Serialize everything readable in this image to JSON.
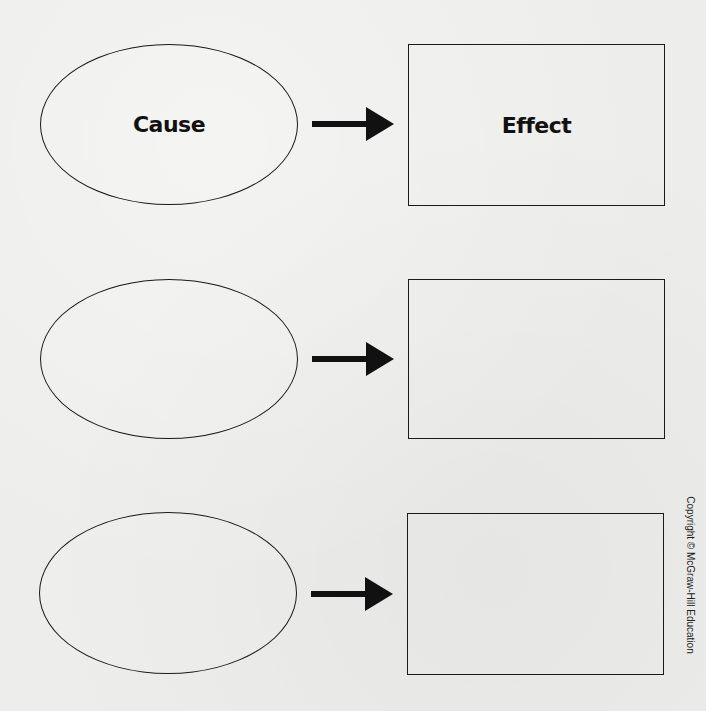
{
  "diagram": {
    "type": "cause-effect graphic organizer",
    "rows": [
      {
        "cause": {
          "label": "Cause"
        },
        "effect": {
          "label": "Effect"
        }
      },
      {
        "cause": {
          "label": ""
        },
        "effect": {
          "label": ""
        }
      },
      {
        "cause": {
          "label": ""
        },
        "effect": {
          "label": ""
        }
      }
    ],
    "arrow_icon": "right-arrow-icon",
    "colors": {
      "stroke": "#1a1a1a",
      "background": "#ededeb"
    }
  },
  "footer": {
    "copyright": "Copyright © McGraw-Hill Education"
  }
}
